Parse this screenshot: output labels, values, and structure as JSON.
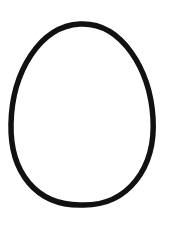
{
  "drawing": {
    "shape": "egg-outline",
    "stroke_color": "#111111",
    "fill_color": "#ffffff",
    "background": "#ffffff"
  }
}
